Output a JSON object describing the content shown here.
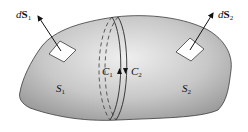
{
  "diagram": {
    "labels": {
      "dS1": {
        "prefix": "d",
        "vector": "S",
        "sub": "1"
      },
      "dS2": {
        "prefix": "d",
        "vector": "S",
        "sub": "2"
      },
      "S1": {
        "name": "S",
        "sub": "1"
      },
      "S2": {
        "name": "S",
        "sub": "2"
      },
      "C1": {
        "name": "C",
        "sub": "1"
      },
      "C2": {
        "name": "C",
        "sub": "2"
      }
    },
    "colors": {
      "surface_light": "#eeeeee",
      "surface_dark": "#a8a8a8",
      "outline": "#3a3a3a",
      "patch": "#ffffff",
      "arrow": "#111111"
    }
  }
}
